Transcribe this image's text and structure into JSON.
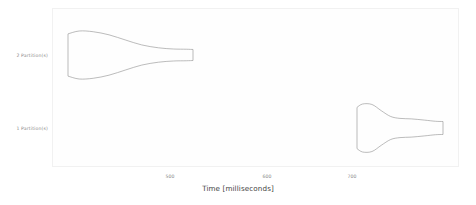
{
  "chart_data": {
    "type": "violin",
    "title": "",
    "xlabel": "Time [milliseconds]",
    "ylabel": "",
    "orientation": "horizontal",
    "grid": false,
    "legend": "none",
    "xlim": [
      425,
      790
    ],
    "xticks": [
      {
        "label": "500",
        "value": 500,
        "px": 170
      },
      {
        "label": "600",
        "value": 600,
        "px": 267
      },
      {
        "label": "700",
        "value": 700,
        "px": 352
      }
    ],
    "categories": [
      "1 Partition(s)",
      "2 Partition(s)"
    ],
    "series": [
      {
        "name": "2 Partition(s)",
        "category": "2 Partition(s)",
        "row_px": 55,
        "min": 443,
        "max": 577,
        "data_min_px": 68,
        "data_max_px": 193,
        "peak": 462,
        "width_profile": [
          {
            "t": 443,
            "w": 0.88
          },
          {
            "t": 455,
            "w": 1.0
          },
          {
            "t": 470,
            "w": 0.97
          },
          {
            "t": 487,
            "w": 0.84
          },
          {
            "t": 505,
            "w": 0.62
          },
          {
            "t": 522,
            "w": 0.42
          },
          {
            "t": 540,
            "w": 0.3
          },
          {
            "t": 556,
            "w": 0.25
          },
          {
            "t": 570,
            "w": 0.24
          },
          {
            "t": 577,
            "w": 0.23
          }
        ]
      },
      {
        "name": "1 Partition(s)",
        "category": "1 Partition(s)",
        "row_px": 128,
        "min": 754,
        "max": 846,
        "data_min_px": 357,
        "data_max_px": 443,
        "peak": 762,
        "width_profile": [
          {
            "t": 754,
            "w": 0.86
          },
          {
            "t": 760,
            "w": 1.0
          },
          {
            "t": 770,
            "w": 0.98
          },
          {
            "t": 780,
            "w": 0.72
          },
          {
            "t": 790,
            "w": 0.48
          },
          {
            "t": 800,
            "w": 0.4
          },
          {
            "t": 812,
            "w": 0.38
          },
          {
            "t": 826,
            "w": 0.33
          },
          {
            "t": 838,
            "w": 0.28
          },
          {
            "t": 846,
            "w": 0.27
          }
        ]
      }
    ],
    "style": {
      "violin_outline_color": "#8f8f8f",
      "violin_fill": "none",
      "plot_background": "#fefefe",
      "figure_background": "#ffffff",
      "tick_label_color": "#8a8a8a",
      "axis_title_color": "#3f3f3f"
    }
  },
  "axes": {
    "y_tick_labels": [
      "2 Partition(s)",
      "1 Partition(s)"
    ],
    "x_tick_labels": [
      "500",
      "600",
      "700"
    ],
    "x_title": "Time [milliseconds]"
  }
}
